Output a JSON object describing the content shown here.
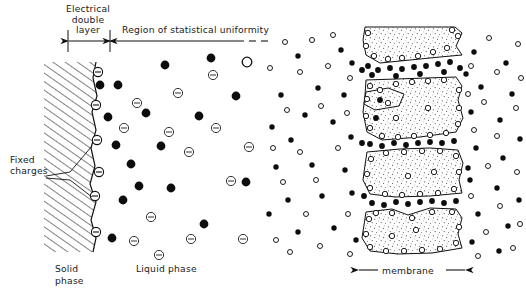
{
  "figure": {
    "panels": [
      {
        "id": "left",
        "name": "double-layer-panel"
      },
      {
        "id": "right",
        "name": "membrane-panel"
      }
    ]
  },
  "labels": {
    "electrical_double_layer_line1": "Electrical",
    "electrical_double_layer_line2": "double",
    "electrical_double_layer_line3": "layer",
    "region_uniformity": "Region of statistical uniformity",
    "fixed_charges_line1": "Fixed",
    "fixed_charges_line2": "charges",
    "solid_phase_line1": "Solid",
    "solid_phase_line2": "phase",
    "liquid_phase": "Liquid phase",
    "membrane": "membrane"
  },
  "colors": {
    "ink": "#1a1a1a",
    "line": "#111111",
    "fill_particle": "#0d0d0d",
    "open_particle": "#ffffff",
    "stipple": "#4d4d4d",
    "hatch": "#111111",
    "background": "#ffffff"
  },
  "legend_semantics": {
    "filled_circle": "co-ion / cation (filled)",
    "open_circle_minus": "negative ion (circle with minus sign)",
    "open_circle_plain": "positive ion (plain open circle)",
    "hatched_region": "solid phase",
    "stippled_region": "membrane matrix"
  },
  "left_panel": {
    "wall_x": 96,
    "dimension_line_y": 41,
    "dimension_arrow_left_x": 68,
    "dimension_arrow_mid_x": 110,
    "dimension_dash_end_x": 266,
    "fixed_charges": [
      {
        "x": 98,
        "y": 72
      },
      {
        "x": 96,
        "y": 105
      },
      {
        "x": 97,
        "y": 140
      },
      {
        "x": 99,
        "y": 172
      },
      {
        "x": 97,
        "y": 196
      },
      {
        "x": 96,
        "y": 232
      }
    ],
    "filled_particles": [
      {
        "x": 116,
        "y": 145
      },
      {
        "x": 100,
        "y": 85
      },
      {
        "x": 118,
        "y": 85
      },
      {
        "x": 108,
        "y": 117
      },
      {
        "x": 123,
        "y": 200
      },
      {
        "x": 139,
        "y": 186
      },
      {
        "x": 146,
        "y": 113
      },
      {
        "x": 161,
        "y": 146
      },
      {
        "x": 165,
        "y": 65
      },
      {
        "x": 171,
        "y": 188
      },
      {
        "x": 199,
        "y": 116
      },
      {
        "x": 204,
        "y": 224
      },
      {
        "x": 211,
        "y": 58
      },
      {
        "x": 236,
        "y": 96
      },
      {
        "x": 246,
        "y": 182
      },
      {
        "x": 131,
        "y": 164
      },
      {
        "x": 112,
        "y": 238
      }
    ],
    "minus_particles": [
      {
        "x": 137,
        "y": 103
      },
      {
        "x": 124,
        "y": 128
      },
      {
        "x": 151,
        "y": 217
      },
      {
        "x": 159,
        "y": 255
      },
      {
        "x": 169,
        "y": 132
      },
      {
        "x": 178,
        "y": 93
      },
      {
        "x": 189,
        "y": 152
      },
      {
        "x": 191,
        "y": 239
      },
      {
        "x": 213,
        "y": 75
      },
      {
        "x": 216,
        "y": 128
      },
      {
        "x": 231,
        "y": 181
      },
      {
        "x": 243,
        "y": 239
      },
      {
        "x": 249,
        "y": 147
      },
      {
        "x": 134,
        "y": 241
      }
    ],
    "plain_open_particles": [
      {
        "x": 247,
        "y": 62
      }
    ],
    "leader_lines": [
      {
        "x1": 47,
        "y1": 177,
        "x2": 92,
        "y2": 151
      },
      {
        "x1": 47,
        "y1": 178,
        "x2": 94,
        "y2": 196
      }
    ]
  },
  "right_panel": {
    "membrane_left_x": 360,
    "membrane_right_x": 465,
    "membrane_label_y": 270,
    "bulk_filled_count": 34,
    "bulk_open_count": 36,
    "blocks": 5
  }
}
